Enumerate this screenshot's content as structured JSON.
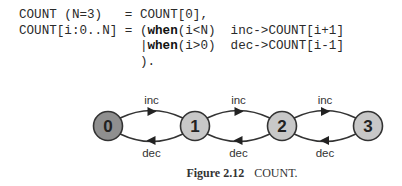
{
  "code": {
    "lines": [
      {
        "parts": [
          {
            "text": "COUNT (N=3)   = COUNT[0],",
            "bold": false
          }
        ]
      },
      {
        "parts": [
          {
            "text": "COUNT[i:0..N] = (",
            "bold": false
          },
          {
            "text": "when",
            "bold": true
          },
          {
            "text": "(i<N)  inc->COUNT[i+1]",
            "bold": false
          }
        ]
      },
      {
        "parts": [
          {
            "text": "                |",
            "bold": false
          },
          {
            "text": "when",
            "bold": true
          },
          {
            "text": "(i>0)  dec->COUNT[i-1]",
            "bold": false
          }
        ]
      },
      {
        "parts": [
          {
            "text": "                ).",
            "bold": false
          }
        ]
      }
    ]
  },
  "diagram": {
    "states": [
      {
        "id": "0",
        "label": "0",
        "x": 108,
        "y": 126,
        "fill": "#8f8f8f",
        "initial": true
      },
      {
        "id": "1",
        "label": "1",
        "x": 195,
        "y": 126,
        "fill": "#c8c8c8",
        "initial": false
      },
      {
        "id": "2",
        "label": "2",
        "x": 282,
        "y": 126,
        "fill": "#c8c8c8",
        "initial": false
      },
      {
        "id": "3",
        "label": "3",
        "x": 368,
        "y": 126,
        "fill": "#c8c8c8",
        "initial": false
      }
    ],
    "transitions": [
      {
        "from": "0",
        "to": "1",
        "label": "inc"
      },
      {
        "from": "1",
        "to": "2",
        "label": "inc"
      },
      {
        "from": "2",
        "to": "3",
        "label": "inc"
      },
      {
        "from": "1",
        "to": "0",
        "label": "dec"
      },
      {
        "from": "2",
        "to": "1",
        "label": "dec"
      },
      {
        "from": "3",
        "to": "2",
        "label": "dec"
      }
    ],
    "node_radius": 14.5,
    "stroke_color": "#333333"
  },
  "caption": {
    "figure_number": "Figure 2.12",
    "title": "COUNT."
  }
}
